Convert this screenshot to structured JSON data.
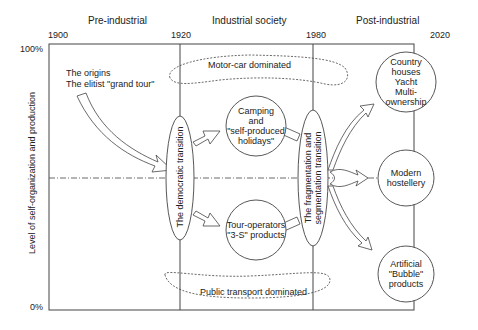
{
  "eras": {
    "pre": "Pre-industrial",
    "industrial": "Industrial society",
    "post": "Post-industrial"
  },
  "years": [
    "1900",
    "1920",
    "1980",
    "2020"
  ],
  "axis": {
    "y_top": "100%",
    "y_bottom": "0%",
    "y_label": "Level of self-organization and production"
  },
  "origins": {
    "line1": "The origins",
    "line2": "The elitist \"grand tour\""
  },
  "regions": {
    "motor": "Motor-car dominated",
    "public": "Public transport dominated"
  },
  "transitions": {
    "democratic": "The democratic transition",
    "fragmentation_line1": "The fragmentation and",
    "fragmentation_line2": "segmentation transition"
  },
  "nodes": {
    "camping": [
      "Camping",
      "and",
      "\"self-produced",
      "holidays\""
    ],
    "tour": [
      "Tour-operators",
      "\"3-S\" products"
    ],
    "country": [
      "Country houses",
      "Yacht",
      "Multi-ownership"
    ],
    "modern": [
      "Modern",
      "hostellery"
    ],
    "artificial": [
      "Artificial",
      "\"Bubble\"",
      "products"
    ]
  }
}
